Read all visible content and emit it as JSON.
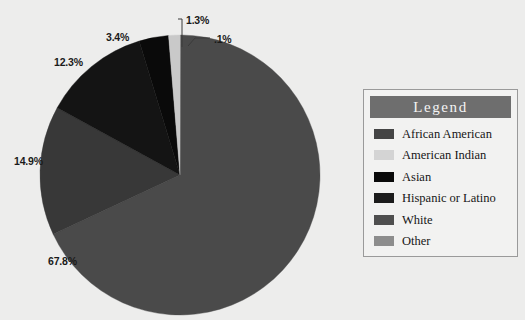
{
  "chart_data": {
    "type": "pie",
    "title": "",
    "categories": [
      "Other",
      "White",
      "African American",
      "Hispanic or Latino",
      "Asian",
      "American Indian"
    ],
    "values": [
      0.1,
      67.8,
      14.9,
      12.3,
      3.4,
      1.3
    ],
    "labels": [
      ".1%",
      "67.8%",
      "14.9%",
      "12.3%",
      "3.4%",
      "1.3%"
    ],
    "colors": [
      "#8d8d8d",
      "#4a4a4a",
      "#383838",
      "#141414",
      "#0a0a0a",
      "#c9c9c9"
    ],
    "start_angle_deg": 0,
    "direction": "clockwise",
    "legend_position": "right",
    "grid": false,
    "xlabel": "",
    "ylabel": ""
  },
  "pie": {
    "callout_labels": [
      {
        "text": "1.3%",
        "x": 186,
        "y": 14
      },
      {
        "text": ".1%",
        "x": 214,
        "y": 33
      },
      {
        "text": "3.4%",
        "x": 106,
        "y": 31
      },
      {
        "text": "12.3%",
        "x": 54,
        "y": 56
      },
      {
        "text": "14.9%",
        "x": 14,
        "y": 155
      },
      {
        "text": "67.8%",
        "x": 48,
        "y": 255
      }
    ]
  },
  "legend": {
    "title": "Legend",
    "items": [
      {
        "label": "African American",
        "color": "#454545"
      },
      {
        "label": "American Indian",
        "color": "#d4d4d4"
      },
      {
        "label": "Asian",
        "color": "#0a0a0a"
      },
      {
        "label": "Hispanic or Latino",
        "color": "#1c1c1c"
      },
      {
        "label": "White",
        "color": "#4f4f4f"
      },
      {
        "label": "Other",
        "color": "#8d8d8d"
      }
    ]
  },
  "colors": {
    "background": "#ededec",
    "legend_header": "#6e6e6e",
    "legend_border": "#9a9a9a",
    "label_text": "#1a1a1a",
    "leader_line": "#3a3a3a"
  }
}
